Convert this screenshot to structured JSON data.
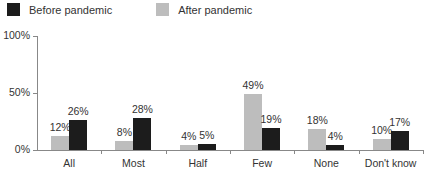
{
  "chart_data": {
    "type": "bar",
    "title": "",
    "xlabel": "",
    "ylabel": "",
    "ylim": [
      0,
      100
    ],
    "yticks": [
      "0%",
      "50%",
      "100%"
    ],
    "categories": [
      "All",
      "Most",
      "Half",
      "Few",
      "None",
      "Don't know"
    ],
    "series": [
      {
        "name": "After pandemic",
        "color": "#bdbdbd",
        "values": [
          12,
          8,
          4,
          49,
          18,
          10
        ],
        "labels": [
          "12%",
          "8%",
          "4%",
          "49%",
          "18%",
          "10%"
        ]
      },
      {
        "name": "Before pandemic",
        "color": "#1c1c1c",
        "values": [
          26,
          28,
          5,
          19,
          4,
          17
        ],
        "labels": [
          "26%",
          "28%",
          "5%",
          "19%",
          "4%",
          "17%"
        ]
      }
    ],
    "legend": {
      "position": "top",
      "entries": [
        "Before pandemic",
        "After pandemic"
      ]
    },
    "grid": false
  },
  "legend": {
    "before": "Before pandemic",
    "after": "After pandemic"
  },
  "axis": {
    "y0": "0%",
    "y50": "50%",
    "y100": "100%"
  }
}
